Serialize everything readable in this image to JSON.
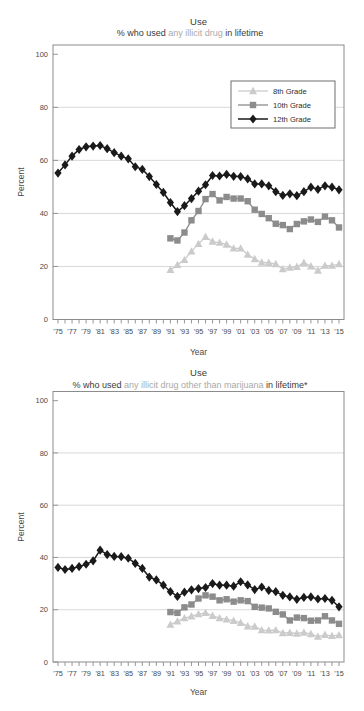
{
  "chart_data": [
    {
      "type": "line",
      "title": "Use",
      "subtitle": {
        "prefix": "% who used ",
        "highlight": "any illicit drug",
        "suffix": " in lifetime"
      },
      "xlabel": "Year",
      "ylabel": "Percent",
      "ylim": [
        0,
        100
      ],
      "yticks": [
        0,
        20,
        40,
        60,
        80,
        100
      ],
      "gridlines": [
        20,
        40,
        60,
        80
      ],
      "x_start": 1975,
      "x_end": 2015,
      "x_tick_step": 2,
      "x_tick_labels": [
        "'75",
        "'77",
        "'79",
        "'81",
        "'83",
        "'85",
        "'87",
        "'89",
        "'91",
        "'93",
        "'95",
        "'97",
        "'99",
        "'01",
        "'03",
        "'05",
        "'07",
        "'09",
        "'11",
        "'13",
        "'15"
      ],
      "legend": {
        "visible": true,
        "position": "top-right",
        "entries": [
          "8th Grade",
          "10th Grade",
          "12th Grade"
        ]
      },
      "series": [
        {
          "name": "8th Grade",
          "marker": "triangle",
          "color": "#cbcbcb",
          "start_year": 1991,
          "values": [
            18.7,
            20.6,
            22.5,
            25.7,
            28.5,
            31.2,
            29.4,
            29.0,
            28.3,
            26.8,
            26.8,
            24.5,
            22.8,
            21.5,
            21.4,
            20.9,
            19.0,
            19.6,
            19.9,
            21.4,
            20.1,
            18.5,
            20.3,
            20.3,
            20.9
          ]
        },
        {
          "name": "10th Grade",
          "marker": "square",
          "color": "#8c8c8c",
          "start_year": 1991,
          "values": [
            30.6,
            29.8,
            32.8,
            37.4,
            40.9,
            45.4,
            47.3,
            44.9,
            46.2,
            45.6,
            45.6,
            44.6,
            41.4,
            39.8,
            38.2,
            36.1,
            35.6,
            34.1,
            36.0,
            37.0,
            37.7,
            36.8,
            38.8,
            37.4,
            34.7
          ]
        },
        {
          "name": "12th Grade",
          "marker": "diamond",
          "color": "#1a1a1a",
          "start_year": 1975,
          "values": [
            55.2,
            58.3,
            61.6,
            64.1,
            65.1,
            65.4,
            65.6,
            64.4,
            62.9,
            61.6,
            60.6,
            57.6,
            56.6,
            53.9,
            50.9,
            47.9,
            44.1,
            40.7,
            42.9,
            45.6,
            48.4,
            50.8,
            54.3,
            54.1,
            54.7,
            54.0,
            53.9,
            53.0,
            51.1,
            51.1,
            50.4,
            48.2,
            46.8,
            47.4,
            46.7,
            48.2,
            49.9,
            49.1,
            50.4,
            49.9,
            48.9
          ]
        }
      ]
    },
    {
      "type": "line",
      "title": "Use",
      "subtitle": {
        "prefix": "% who used ",
        "highlight": "any illicit drug other than marijuana",
        "suffix": " in lifetime*"
      },
      "xlabel": "Year",
      "ylabel": "Percent",
      "ylim": [
        0,
        100
      ],
      "yticks": [
        0,
        20,
        40,
        60,
        80,
        100
      ],
      "gridlines": [
        20,
        40,
        60,
        80
      ],
      "x_start": 1975,
      "x_end": 2015,
      "x_tick_step": 2,
      "x_tick_labels": [
        "'75",
        "'77",
        "'79",
        "'81",
        "'83",
        "'85",
        "'87",
        "'89",
        "'91",
        "'93",
        "'95",
        "'97",
        "'99",
        "'01",
        "'03",
        "'05",
        "'07",
        "'09",
        "'11",
        "'13",
        "'15"
      ],
      "legend": {
        "visible": false,
        "position": "top-right",
        "entries": [
          "8th Grade",
          "10th Grade",
          "12th Grade"
        ]
      },
      "series": [
        {
          "name": "8th Grade",
          "marker": "triangle",
          "color": "#cbcbcb",
          "start_year": 1991,
          "values": [
            14.3,
            15.6,
            16.8,
            17.5,
            18.3,
            18.8,
            17.7,
            16.8,
            16.3,
            15.8,
            15.0,
            13.7,
            13.6,
            12.2,
            12.1,
            12.2,
            11.1,
            11.2,
            10.9,
            11.3,
            10.7,
            9.7,
            10.4,
            10.0,
            10.3
          ]
        },
        {
          "name": "10th Grade",
          "marker": "square",
          "color": "#8c8c8c",
          "start_year": 1991,
          "values": [
            19.1,
            18.8,
            20.9,
            22.0,
            24.3,
            25.5,
            25.0,
            23.6,
            24.0,
            23.1,
            23.6,
            23.3,
            21.1,
            20.8,
            20.5,
            19.2,
            18.2,
            15.9,
            17.0,
            16.8,
            15.8,
            15.9,
            17.5,
            15.9,
            14.6
          ]
        },
        {
          "name": "12th Grade",
          "marker": "diamond",
          "color": "#1a1a1a",
          "start_year": 1975,
          "values": [
            36.2,
            35.4,
            35.8,
            36.5,
            37.4,
            38.7,
            42.8,
            41.1,
            40.4,
            40.3,
            39.7,
            37.7,
            35.8,
            32.5,
            31.4,
            29.4,
            26.9,
            25.1,
            26.7,
            27.6,
            28.1,
            28.5,
            30.0,
            29.4,
            29.4,
            29.0,
            30.7,
            29.5,
            27.7,
            28.7,
            27.4,
            26.9,
            25.5,
            24.9,
            24.0,
            24.7,
            24.9,
            24.1,
            24.3,
            23.6,
            21.1
          ]
        }
      ]
    }
  ],
  "style": {
    "grid_color": "#d4d4d4",
    "axis_color": "#8c8c8c",
    "tick_label_color": "#4a4a4a",
    "subtitle_highlight_color": "#a9a9a9",
    "legend_border_color": "#6e6e6e"
  }
}
